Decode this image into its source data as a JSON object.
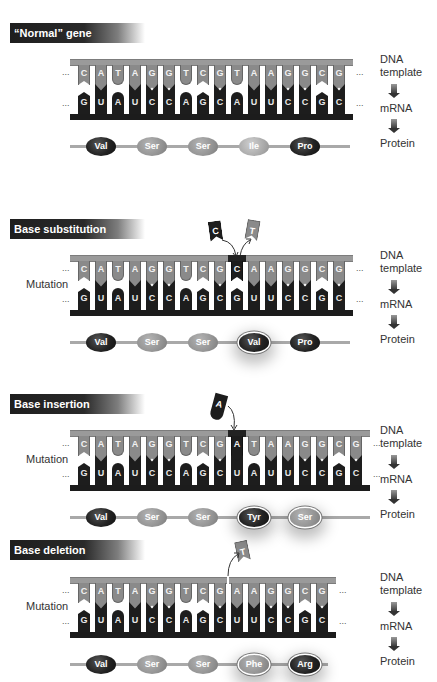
{
  "side_labels": {
    "dna": "DNA\ntemplate",
    "dna_line1": "DNA",
    "dna_line2": "template",
    "mrna": "mRNA",
    "protein": "Protein"
  },
  "mutation_label": "Mutation",
  "ellipsis": "...",
  "panels": [
    {
      "title": "“Normal” gene",
      "dna": [
        "C",
        "A",
        "T",
        "A",
        "G",
        "G",
        "T",
        "C",
        "G",
        "T",
        "A",
        "A",
        "G",
        "G",
        "C",
        "G"
      ],
      "mrna": [
        "G",
        "U",
        "A",
        "U",
        "C",
        "C",
        "A",
        "G",
        "C",
        "A",
        "U",
        "U",
        "C",
        "C",
        "G",
        "C"
      ],
      "protein": [
        "Val",
        "Ser",
        "Ser",
        "Ile",
        "Pro"
      ]
    },
    {
      "title": "Base substitution",
      "removed_base": "C",
      "replaced_base": "T",
      "mutated_index": 9,
      "dna": [
        "C",
        "A",
        "T",
        "A",
        "G",
        "G",
        "T",
        "C",
        "G",
        "C",
        "A",
        "A",
        "G",
        "G",
        "C",
        "G"
      ],
      "mrna": [
        "G",
        "U",
        "A",
        "U",
        "C",
        "C",
        "A",
        "G",
        "C",
        "G",
        "U",
        "U",
        "C",
        "C",
        "G",
        "C"
      ],
      "protein": [
        "Val",
        "Ser",
        "Ser",
        "Val",
        "Pro"
      ],
      "changed_protein": [
        3
      ]
    },
    {
      "title": "Base insertion",
      "inserted_base": "A",
      "mutated_index": 9,
      "dna": [
        "C",
        "A",
        "T",
        "A",
        "G",
        "G",
        "T",
        "C",
        "G",
        "A",
        "T",
        "A",
        "A",
        "G",
        "G",
        "C",
        "G"
      ],
      "mrna": [
        "G",
        "U",
        "A",
        "U",
        "C",
        "C",
        "A",
        "G",
        "C",
        "U",
        "A",
        "U",
        "U",
        "C",
        "C",
        "G",
        "C"
      ],
      "protein": [
        "Val",
        "Ser",
        "Ser",
        "Tyr",
        "Ser"
      ],
      "changed_protein": [
        3,
        4
      ]
    },
    {
      "title": "Base deletion",
      "deleted_base": "T",
      "dna": [
        "C",
        "A",
        "T",
        "A",
        "G",
        "G",
        "T",
        "C",
        "G",
        "A",
        "A",
        "G",
        "G",
        "C",
        "G"
      ],
      "mrna": [
        "G",
        "U",
        "A",
        "U",
        "C",
        "C",
        "A",
        "G",
        "C",
        "U",
        "U",
        "C",
        "C",
        "G",
        "C"
      ],
      "protein": [
        "Val",
        "Ser",
        "Ser",
        "Phe",
        "Arg"
      ],
      "changed_protein": [
        3,
        4
      ]
    }
  ]
}
